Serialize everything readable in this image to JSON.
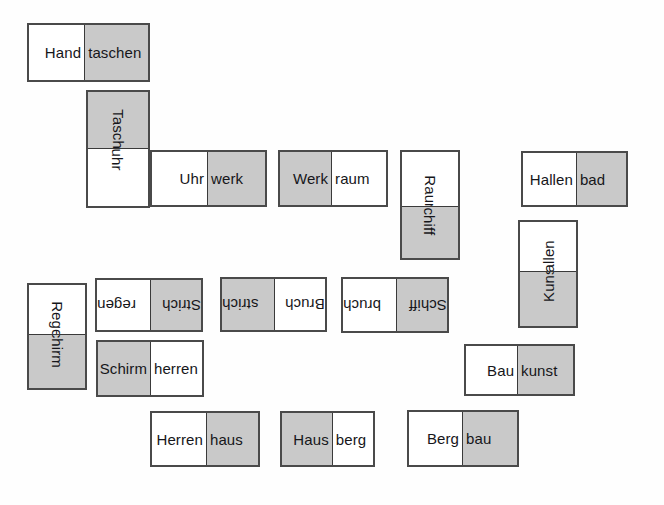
{
  "page": {
    "background_color": "#fefefe",
    "cell_white": "#ffffff",
    "cell_gray": "#c9c9c9",
    "border_color": "#4a4a4a",
    "text_color": "#16161a"
  },
  "dominoes": [
    {
      "id": "handtaschen",
      "word": "Handtaschen",
      "orientation": "horizontal",
      "rotation": 0,
      "x": 27,
      "y": 23,
      "w": 123,
      "h": 59,
      "split": 58,
      "cells": [
        {
          "text": "Hand",
          "fill": "white"
        },
        {
          "text": "taschen",
          "fill": "gray"
        }
      ]
    },
    {
      "id": "taschenuhr",
      "word": "Taschenuhr",
      "orientation": "vertical",
      "rotation": 90,
      "x": 86,
      "y": 90,
      "w": 64,
      "h": 118,
      "split": 59,
      "cells": [
        {
          "text": "Taschen",
          "fill": "gray"
        },
        {
          "text": "uhr",
          "fill": "white"
        }
      ]
    },
    {
      "id": "uhrwerk",
      "word": "Uhrwerk",
      "orientation": "horizontal",
      "rotation": 0,
      "x": 150,
      "y": 150,
      "w": 117,
      "h": 57,
      "split": 58,
      "cells": [
        {
          "text": "Uhr",
          "fill": "white"
        },
        {
          "text": "werk",
          "fill": "gray"
        }
      ]
    },
    {
      "id": "werkraum",
      "word": "Werkraum",
      "orientation": "horizontal",
      "rotation": 0,
      "x": 278,
      "y": 150,
      "w": 110,
      "h": 57,
      "split": 54,
      "cells": [
        {
          "text": "Werk",
          "fill": "gray"
        },
        {
          "text": "raum",
          "fill": "white"
        }
      ]
    },
    {
      "id": "raumschiff",
      "word": "Raumschiff",
      "orientation": "vertical",
      "rotation": 90,
      "x": 400,
      "y": 150,
      "w": 60,
      "h": 110,
      "split": 57,
      "cells": [
        {
          "text": "Raum",
          "fill": "white"
        },
        {
          "text": "schiff",
          "fill": "gray"
        }
      ]
    },
    {
      "id": "hallenbad",
      "word": "Hallenbad",
      "orientation": "horizontal",
      "rotation": 0,
      "x": 521,
      "y": 151,
      "w": 107,
      "h": 56,
      "split": 56,
      "cells": [
        {
          "text": "Hallen",
          "fill": "white"
        },
        {
          "text": "bad",
          "fill": "gray"
        }
      ]
    },
    {
      "id": "kunsthallen",
      "word": "Kunsthallen",
      "orientation": "vertical",
      "rotation": 270,
      "x": 518,
      "y": 220,
      "w": 60,
      "h": 108,
      "split": 52,
      "cells": [
        {
          "text": "hallen",
          "fill": "white"
        },
        {
          "text": "Kunst",
          "fill": "gray"
        }
      ]
    },
    {
      "id": "baukunst",
      "word": "Baukunst",
      "orientation": "horizontal",
      "rotation": 0,
      "x": 464,
      "y": 344,
      "w": 111,
      "h": 52,
      "split": 54,
      "cells": [
        {
          "text": "Bau",
          "fill": "white"
        },
        {
          "text": "kunst",
          "fill": "gray"
        }
      ]
    },
    {
      "id": "regenschirm",
      "word": "Regenschirm",
      "orientation": "vertical",
      "rotation": 90,
      "x": 27,
      "y": 283,
      "w": 60,
      "h": 107,
      "split": 52,
      "cells": [
        {
          "text": "Regen",
          "fill": "white"
        },
        {
          "text": "schirm",
          "fill": "gray"
        }
      ]
    },
    {
      "id": "strichregen",
      "word": "Strichregen",
      "orientation": "horizontal",
      "rotation": 180,
      "x": 95,
      "y": 278,
      "w": 108,
      "h": 54,
      "split": 56,
      "cells": [
        {
          "text": "regen",
          "fill": "white"
        },
        {
          "text": "Strich",
          "fill": "gray"
        }
      ]
    },
    {
      "id": "schirmherren",
      "word": "Schirmherren",
      "orientation": "horizontal",
      "rotation": 0,
      "x": 96,
      "y": 340,
      "w": 108,
      "h": 57,
      "split": 55,
      "cells": [
        {
          "text": "Schirm",
          "fill": "gray"
        },
        {
          "text": "herren",
          "fill": "white"
        }
      ]
    },
    {
      "id": "bruchstrich",
      "word": "Bruchstrich",
      "orientation": "horizontal",
      "rotation": 180,
      "x": 220,
      "y": 277,
      "w": 107,
      "h": 55,
      "split": 55,
      "cells": [
        {
          "text": "strich",
          "fill": "gray"
        },
        {
          "text": "Bruch",
          "fill": "white"
        }
      ]
    },
    {
      "id": "schiffbruch",
      "word": "Schiffbruch",
      "orientation": "horizontal",
      "rotation": 180,
      "x": 341,
      "y": 277,
      "w": 108,
      "h": 56,
      "split": 56,
      "cells": [
        {
          "text": "bruch",
          "fill": "white"
        },
        {
          "text": "Schiff",
          "fill": "gray"
        }
      ]
    },
    {
      "id": "herrenhaus",
      "word": "Herrenhaus",
      "orientation": "horizontal",
      "rotation": 0,
      "x": 150,
      "y": 411,
      "w": 110,
      "h": 56,
      "split": 57,
      "cells": [
        {
          "text": "Herren",
          "fill": "white"
        },
        {
          "text": "haus",
          "fill": "gray"
        }
      ]
    },
    {
      "id": "hausberg",
      "word": "Hausberg",
      "orientation": "horizontal",
      "rotation": 0,
      "x": 280,
      "y": 411,
      "w": 95,
      "h": 56,
      "split": 53,
      "cells": [
        {
          "text": "Haus",
          "fill": "gray"
        },
        {
          "text": "berg",
          "fill": "white"
        }
      ]
    },
    {
      "id": "bergbau",
      "word": "Bergbau",
      "orientation": "horizontal",
      "rotation": 0,
      "x": 407,
      "y": 410,
      "w": 112,
      "h": 57,
      "split": 56,
      "cells": [
        {
          "text": "Berg",
          "fill": "white"
        },
        {
          "text": "bau",
          "fill": "gray"
        }
      ]
    }
  ]
}
